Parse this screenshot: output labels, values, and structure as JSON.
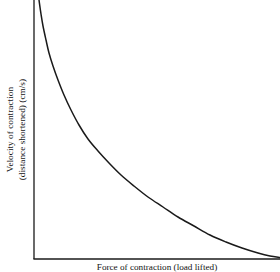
{
  "figure": {
    "background_color": "#ffffff",
    "line_color": "#1a1a1a",
    "axis_color": "#1a1a1a"
  },
  "axes": {
    "y_label_line1": "Velocity of contraction",
    "y_label_line2": "(distance shortened) (cm/s)",
    "x_label": "Force of contraction (load lifted)"
  },
  "chart_data": {
    "type": "line",
    "title": "",
    "xlabel": "Force of contraction (load lifted)",
    "ylabel": "Velocity of contraction (distance shortened) (cm/s)",
    "grid": false,
    "legend": "none",
    "xlim": [
      0,
      100
    ],
    "ylim": [
      0,
      100
    ],
    "x_ticks": [],
    "y_ticks": [],
    "series": [
      {
        "name": "Load-velocity relationship",
        "x": [
          0,
          2,
          4,
          6,
          8,
          10,
          13,
          16,
          20,
          24,
          28,
          33,
          38,
          43,
          48,
          54,
          60,
          66,
          72,
          78,
          84,
          90,
          95,
          100
        ],
        "y": [
          100,
          86,
          75,
          66,
          58,
          52,
          44,
          38,
          31,
          26,
          22,
          17.5,
          14,
          11,
          8.8,
          6.5,
          4.8,
          3.5,
          2.5,
          1.7,
          1.1,
          0.6,
          0.3,
          0.1
        ]
      }
    ],
    "path_points_px": [
      [
        39,
        0
      ],
      [
        41,
        14
      ],
      [
        43,
        26
      ],
      [
        46,
        40
      ],
      [
        49,
        53
      ],
      [
        53,
        66
      ],
      [
        58,
        80
      ],
      [
        64,
        95
      ],
      [
        71,
        110
      ],
      [
        79,
        125
      ],
      [
        88,
        139
      ],
      [
        98,
        151
      ],
      [
        109,
        163
      ],
      [
        121,
        175
      ],
      [
        134,
        186
      ],
      [
        148,
        197
      ],
      [
        163,
        207
      ],
      [
        178,
        217
      ],
      [
        194,
        226
      ],
      [
        210,
        235
      ],
      [
        226,
        242
      ],
      [
        242,
        248
      ],
      [
        258,
        253
      ],
      [
        270,
        256
      ],
      [
        280,
        257.5
      ]
    ]
  }
}
